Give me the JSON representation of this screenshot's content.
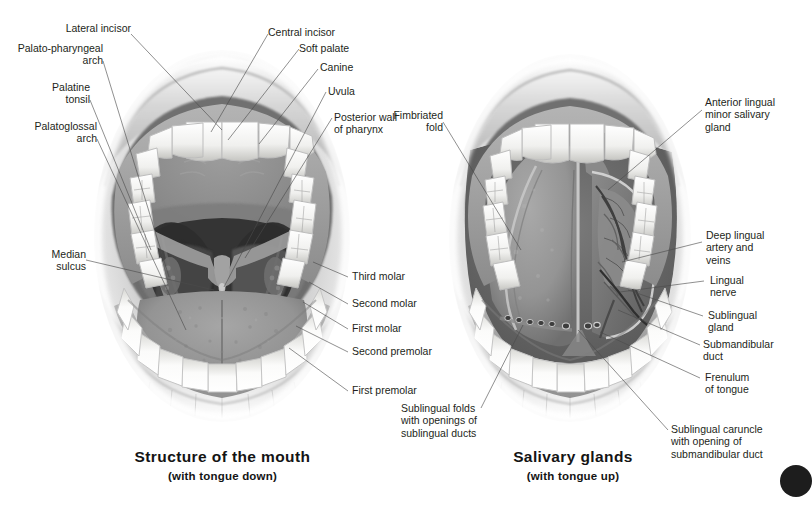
{
  "figure": {
    "kind": "anatomical-illustration",
    "panels": [
      {
        "id": "mouth",
        "title": "Structure of the mouth",
        "subtitle": "(with tongue down)",
        "labels": [
          {
            "text": "Lateral incisor",
            "align": "right"
          },
          {
            "text": "Palato-pharyngeal\narch",
            "align": "right"
          },
          {
            "text": "Palatine\ntonsil",
            "align": "right"
          },
          {
            "text": "Palatoglossal\narch",
            "align": "right"
          },
          {
            "text": "Median\nsulcus",
            "align": "right"
          },
          {
            "text": "Central incisor",
            "align": "left"
          },
          {
            "text": "Soft palate",
            "align": "left"
          },
          {
            "text": "Canine",
            "align": "left"
          },
          {
            "text": "Uvula",
            "align": "left"
          },
          {
            "text": "Posterior wall\nof pharynx",
            "align": "left"
          },
          {
            "text": "Third molar",
            "align": "left"
          },
          {
            "text": "Second molar",
            "align": "left"
          },
          {
            "text": "First molar",
            "align": "left"
          },
          {
            "text": "Second premolar",
            "align": "left"
          },
          {
            "text": "First premolar",
            "align": "left"
          }
        ]
      },
      {
        "id": "salivary",
        "title": "Salivary glands",
        "subtitle": "(with tongue up)",
        "labels": [
          {
            "text": "Fimbriated\nfold",
            "align": "right"
          },
          {
            "text": "Sublingual folds\nwith openings of\nsublingual ducts",
            "align": "left"
          },
          {
            "text": "Anterior lingual\nminor salivary\ngland",
            "align": "left"
          },
          {
            "text": "Deep lingual\nartery and\nveins",
            "align": "left"
          },
          {
            "text": "Lingual\nnerve",
            "align": "left"
          },
          {
            "text": "Sublingual\ngland",
            "align": "left"
          },
          {
            "text": "Submandibular\nduct",
            "align": "left"
          },
          {
            "text": "Frenulum\nof tongue",
            "align": "left"
          },
          {
            "text": "Sublingual caruncle\nwith opening of\nsubmandibular duct",
            "align": "left"
          }
        ]
      }
    ],
    "colors": {
      "background": "#ffffff",
      "text": "#231f20",
      "leader_line": "#4a4a4a",
      "lip_outer": "#d8d8d8",
      "lip_inner": "#a8a8a8",
      "gum": "#9b9b9b",
      "tooth": "#f4f4f2",
      "tooth_shadow": "#c9c9c5",
      "palate": "#8e8e8e",
      "throat_dark": "#3a3a3a",
      "throat_deep": "#262626",
      "tongue": "#9a9a9a",
      "tongue_dark": "#757575",
      "vessel": "#4f4f4f",
      "page_marker": "#1d1d1d"
    }
  }
}
